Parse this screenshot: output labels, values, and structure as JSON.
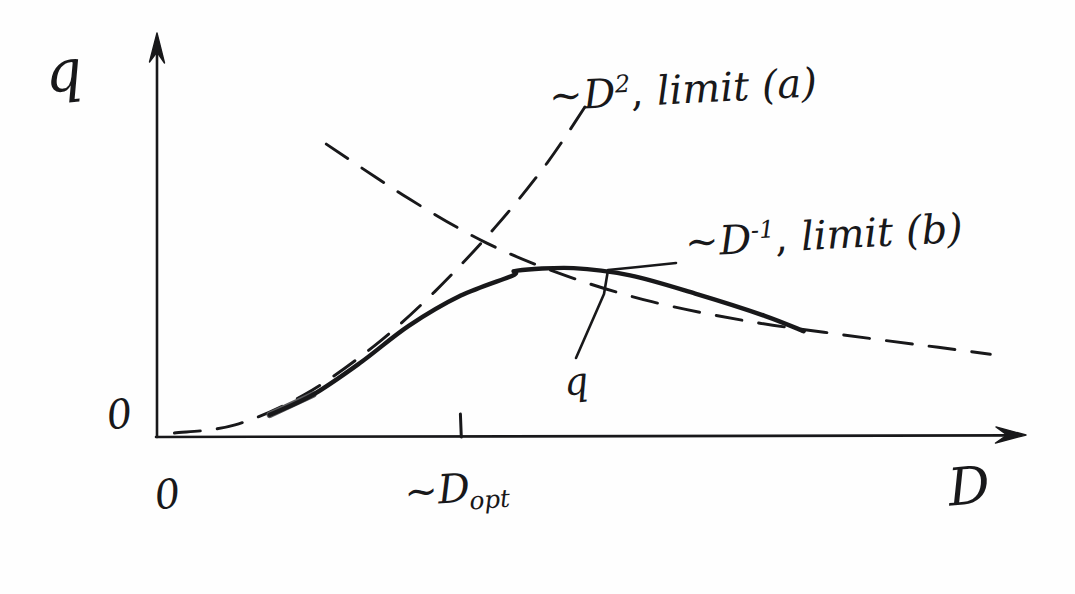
{
  "figure": {
    "kind": "hand-drawn-sketch",
    "background_color": "#fefefe",
    "ink_color": "#18181a"
  },
  "axes": {
    "y_axis_label": "q",
    "x_axis_label": "D",
    "origin_label_y": "0",
    "origin_label_x": "0",
    "x_tick_label_prefix": "~D",
    "x_tick_label_subscript": "opt"
  },
  "annotations": {
    "limit_a": {
      "tilde": "~",
      "base": "D",
      "exponent": "2",
      "comma": ",",
      "text": "limit (a)",
      "full": "~D², limit (a)"
    },
    "limit_b": {
      "tilde": "~",
      "base": "D",
      "exponent": "-1",
      "comma": ",",
      "text": "limit (b)",
      "full": "~D⁻¹, limit (b)"
    },
    "curve_label": "q"
  },
  "chart_data": {
    "type": "line",
    "title": "",
    "xlabel": "D",
    "ylabel": "q",
    "grid": false,
    "legend": "inline-annotations",
    "axis_style": "hand-drawn arrows, no numeric scale",
    "xlim": [
      0,
      1
    ],
    "ylim": [
      0,
      1
    ],
    "x_ticks": [
      {
        "position": 0.0,
        "label": "0"
      },
      {
        "position": 0.35,
        "label": "~D_opt"
      }
    ],
    "y_ticks": [
      {
        "position": 0.0,
        "label": "0"
      }
    ],
    "series": [
      {
        "name": "q",
        "style": "solid",
        "comment": "actual quantity q(D): rises ~D^2 at small D, peaks near D_opt, decays ~D^-1 at large D",
        "points": [
          {
            "x": 0.13,
            "y": 0.055
          },
          {
            "x": 0.18,
            "y": 0.105
          },
          {
            "x": 0.235,
            "y": 0.185
          },
          {
            "x": 0.29,
            "y": 0.275
          },
          {
            "x": 0.35,
            "y": 0.35
          },
          {
            "x": 0.41,
            "y": 0.4
          },
          {
            "x": 0.415,
            "y": 0.412
          },
          {
            "x": 0.48,
            "y": 0.418
          },
          {
            "x": 0.545,
            "y": 0.4
          },
          {
            "x": 0.62,
            "y": 0.355
          },
          {
            "x": 0.7,
            "y": 0.3
          },
          {
            "x": 0.745,
            "y": 0.262
          }
        ]
      },
      {
        "name": "~D^2, limit (a)",
        "style": "dashed",
        "comment": "small-D asymptote growing as D squared",
        "points": [
          {
            "x": 0.02,
            "y": 0.01
          },
          {
            "x": 0.09,
            "y": 0.03
          },
          {
            "x": 0.17,
            "y": 0.105
          },
          {
            "x": 0.25,
            "y": 0.225
          },
          {
            "x": 0.32,
            "y": 0.36
          },
          {
            "x": 0.39,
            "y": 0.52
          },
          {
            "x": 0.45,
            "y": 0.68
          },
          {
            "x": 0.5,
            "y": 0.84
          }
        ]
      },
      {
        "name": "~D^-1, limit (b)",
        "style": "dashed",
        "comment": "large-D asymptote decaying as one over D",
        "points": [
          {
            "x": 0.195,
            "y": 0.725
          },
          {
            "x": 0.29,
            "y": 0.59
          },
          {
            "x": 0.38,
            "y": 0.48
          },
          {
            "x": 0.47,
            "y": 0.4
          },
          {
            "x": 0.57,
            "y": 0.335
          },
          {
            "x": 0.68,
            "y": 0.287
          },
          {
            "x": 0.79,
            "y": 0.253
          },
          {
            "x": 0.9,
            "y": 0.222
          },
          {
            "x": 0.96,
            "y": 0.205
          }
        ]
      }
    ]
  }
}
